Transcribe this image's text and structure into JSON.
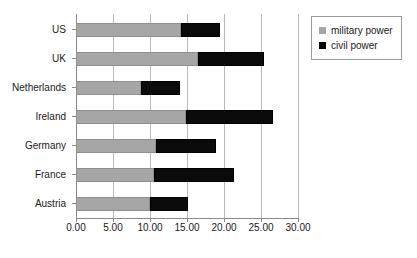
{
  "chart_data": {
    "type": "bar",
    "orientation": "horizontal",
    "stacked": true,
    "title": "",
    "xlabel": "",
    "ylabel": "",
    "xlim": [
      0,
      30
    ],
    "xticks": [
      0,
      5,
      10,
      15,
      20,
      25,
      30
    ],
    "xtick_labels": [
      "0.00",
      "5.00",
      "10.00",
      "15.00",
      "20.00",
      "25.00",
      "30.00"
    ],
    "grid": "vertical",
    "legend_position": "top-right",
    "categories": [
      "US",
      "UK",
      "Netherlands",
      "Ireland",
      "Germany",
      "France",
      "Austria"
    ],
    "series": [
      {
        "name": "military power",
        "color": "#a6a6a6",
        "values": [
          14.2,
          16.5,
          8.8,
          14.9,
          10.8,
          10.6,
          10.0
        ]
      },
      {
        "name": "civil power",
        "color": "#000000",
        "values": [
          5.2,
          8.9,
          5.3,
          11.7,
          8.1,
          10.7,
          5.2
        ]
      }
    ],
    "totals": [
      19.4,
      25.4,
      14.1,
      26.6,
      18.9,
      21.3,
      15.2
    ]
  },
  "legend": {
    "items": [
      {
        "label": "military power",
        "swatch": "military"
      },
      {
        "label": "civil power",
        "swatch": "civil"
      }
    ]
  }
}
